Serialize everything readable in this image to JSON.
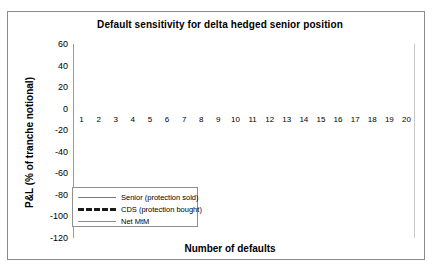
{
  "chart_data": {
    "type": "line",
    "title": "Default sensitivity for delta hedged senior position",
    "xlabel": "Number of defaults",
    "ylabel": "P&L (% of tranche notional)",
    "xlim": [
      0.5,
      20.5
    ],
    "ylim": [
      -120,
      60
    ],
    "grid": true,
    "legend_position": "lower-left-inside",
    "x": [
      1,
      2,
      3,
      4,
      5,
      6,
      7,
      8,
      9,
      10,
      11,
      12,
      13,
      14,
      15,
      16,
      17,
      18,
      19,
      20
    ],
    "xtick_labels": [
      "1",
      "2",
      "3",
      "4",
      "5",
      "6",
      "7",
      "8",
      "9",
      "10",
      "11",
      "12",
      "13",
      "14",
      "15",
      "16",
      "17",
      "18",
      "19",
      "20"
    ],
    "ytick_labels": [
      "60",
      "40",
      "20",
      "0",
      "-20",
      "-40",
      "-60",
      "-80",
      "-100",
      "-120"
    ],
    "ytick_values": [
      60,
      40,
      20,
      0,
      -20,
      -40,
      -60,
      -80,
      -100,
      -120
    ],
    "series": [
      {
        "name": "Senior (protection sold)",
        "style": "solid",
        "color": "#7a7a7a",
        "values": [
          1,
          3,
          5,
          6.5,
          8,
          8.7,
          9,
          8.8,
          8.2,
          7,
          5,
          1,
          -5,
          -14,
          -27,
          -40,
          -49,
          -54,
          -55,
          -54
        ]
      },
      {
        "name": "CDS (protection bought)",
        "style": "dashed",
        "color": "#1a1a1a",
        "values": [
          1,
          4,
          7,
          10,
          13,
          16,
          19,
          22,
          25,
          27,
          29.5,
          32,
          34,
          36,
          38,
          40,
          41.5,
          43,
          44.5,
          46
        ]
      },
      {
        "name": "Net MtM",
        "style": "solid",
        "color": "#8d8d8d",
        "values": [
          0,
          -1.5,
          -3,
          -5,
          -7,
          -9.5,
          -12,
          -15,
          -19,
          -24,
          -30,
          -38,
          -47,
          -58,
          -70,
          -81,
          -90,
          -96,
          -99,
          -100
        ]
      }
    ]
  },
  "legend": {
    "items": [
      {
        "label": "Senior (protection sold)",
        "style": "solid"
      },
      {
        "label": "CDS (protection bought)",
        "style": "dashed"
      },
      {
        "label": "Net MtM",
        "style": "solid"
      }
    ]
  },
  "colors": {
    "background": "#ffffff",
    "border": "#8a8a8a",
    "grid": "#a8a8a8",
    "axis": "#5a5a5a",
    "text": "#000000"
  }
}
